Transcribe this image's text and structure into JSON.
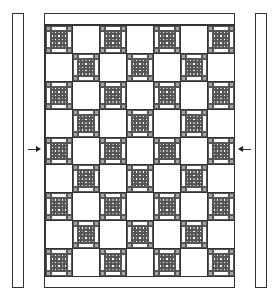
{
  "diagram": {
    "type": "quilt-layout",
    "caption": "",
    "layout": {
      "rows": 9,
      "cols": 7,
      "pattern": "checkerboard",
      "first_block": "pieced",
      "alternate_block": "plain"
    },
    "blocks": {
      "pieced": {
        "description": "Pieced block with gray corner squares, white side rectangles and a 5x5 checkerboard center",
        "center_grid": 5,
        "fabric_dark": "#a6a6a6",
        "fabric_light": "#ffffff"
      },
      "plain": {
        "description": "Plain white setting square",
        "fabric": "#ffffff"
      }
    },
    "borders": {
      "top": "plain border strip",
      "bottom": "plain border strip",
      "side_strips": [
        "left side border strip",
        "right side border strip"
      ]
    },
    "arrows": [
      {
        "side": "left",
        "direction": "right",
        "meaning": "attach left side strip"
      },
      {
        "side": "right",
        "direction": "left",
        "meaning": "attach right side strip"
      }
    ],
    "colors": {
      "line": "#333333",
      "dark_fabric": "#a6a6a6",
      "light_fabric": "#ffffff"
    }
  }
}
